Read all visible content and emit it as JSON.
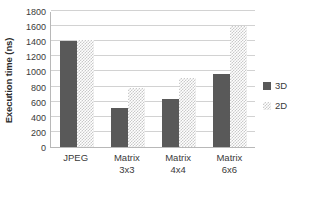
{
  "chart_data": {
    "type": "bar",
    "title": "",
    "xlabel": "",
    "ylabel": "Execution time (ns)",
    "categories": [
      "JPEG",
      "Matrix 3x3",
      "Matrix 4x4",
      "Matrix 6x6"
    ],
    "category_lines": [
      [
        "JPEG",
        ""
      ],
      [
        "Matrix",
        "3x3"
      ],
      [
        "Matrix",
        "4x4"
      ],
      [
        "Matrix",
        "6x6"
      ]
    ],
    "series": [
      {
        "name": "3D",
        "color": "#595959",
        "values": [
          1400,
          520,
          630,
          970
        ]
      },
      {
        "name": "2D",
        "color": "#c9c9c9",
        "values": [
          1420,
          780,
          910,
          1600
        ]
      }
    ],
    "ylim": [
      0,
      1800
    ],
    "ytick_values": [
      0,
      200,
      400,
      600,
      800,
      1000,
      1200,
      1400,
      1600,
      1800
    ],
    "ytick_labels": [
      "0",
      "200",
      "400",
      "600",
      "800",
      "1000",
      "1200",
      "1400",
      "1600",
      "1800"
    ],
    "grid": true,
    "grid_color": "#d2d2d2",
    "legend_position": "right",
    "axis_color": "#b8b8b8",
    "background": "#ffffff"
  }
}
